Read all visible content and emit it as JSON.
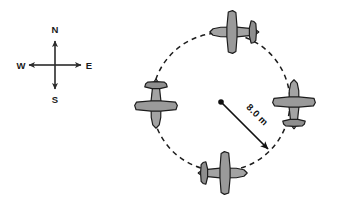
{
  "figure": {
    "background_color": "#ffffff",
    "width": 337,
    "height": 206,
    "line_color": "#1d1d1d",
    "plane_fill_color": "#a3a3a3",
    "plane_outline_color": "#1c1c1c"
  },
  "compass": {
    "name": "compass-rose",
    "center_x": 55,
    "center_y": 65,
    "arm_length": 26,
    "north_label": "N",
    "east_label": "E",
    "south_label": "S",
    "west_label": "W"
  },
  "orbit": {
    "name": "circular-path",
    "center_x": 221,
    "center_y": 102,
    "radius_px": 69,
    "style": "dashed",
    "dash_pattern": "5 4.2"
  },
  "radius": {
    "name": "radius-arrow",
    "label": "8.0 m",
    "value": 8.0,
    "unit": "m",
    "from_x": 221,
    "from_y": 102,
    "to_x": 270,
    "to_y": 151,
    "label_rotation_deg": 45
  },
  "planes": [
    {
      "id": "plane-top",
      "position": "top",
      "heading": "west",
      "rotation_deg": 180,
      "cx": 234,
      "cy": 32
    },
    {
      "id": "plane-right",
      "position": "right",
      "heading": "north",
      "rotation_deg": 270,
      "cx": 294,
      "cy": 104
    },
    {
      "id": "plane-bottom",
      "position": "bottom",
      "heading": "east",
      "rotation_deg": 0,
      "cx": 223,
      "cy": 173
    },
    {
      "id": "plane-left",
      "position": "left",
      "heading": "south",
      "rotation_deg": 90,
      "cx": 156,
      "cy": 104
    }
  ]
}
